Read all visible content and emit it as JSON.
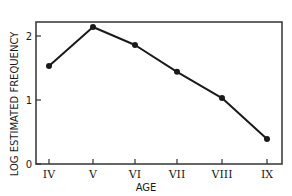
{
  "chart_data": {
    "type": "line",
    "title": "",
    "xlabel": "AGE",
    "ylabel": "LOG ESTIMATED FREQUENCY",
    "categories": [
      "IV",
      "V",
      "VI",
      "VII",
      "VIII",
      "IX"
    ],
    "values": [
      1.53,
      2.14,
      1.86,
      1.44,
      1.03,
      0.39
    ],
    "series": [
      {
        "name": "Log estimated frequency",
        "values": [
          1.53,
          2.14,
          1.86,
          1.44,
          1.03,
          0.39
        ]
      }
    ],
    "ylim": [
      0,
      2.25
    ],
    "yticks": [
      "0",
      "1",
      "2"
    ],
    "grid": false,
    "legend": "none"
  },
  "colors": {
    "line": "#1a1a1a",
    "marker": "#1a1a1a",
    "frame": "#333333",
    "background": "#ffffff"
  }
}
